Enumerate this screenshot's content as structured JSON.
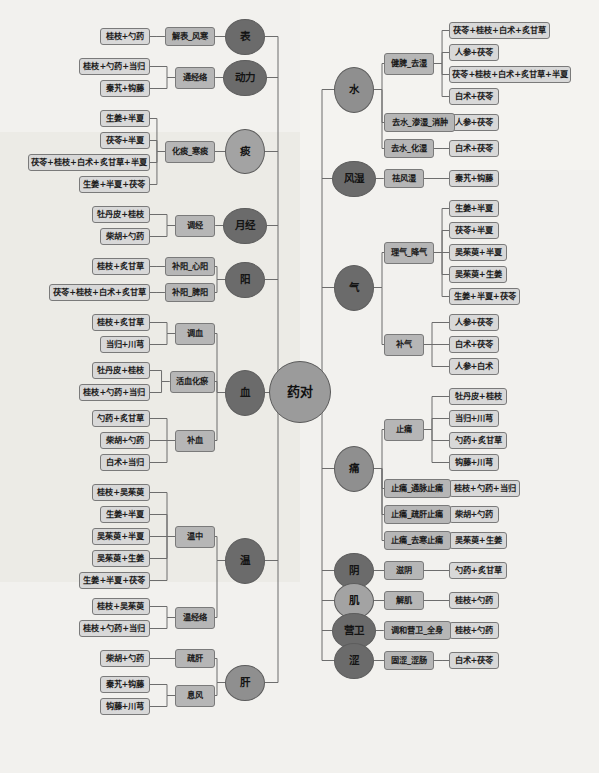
{
  "diagram": {
    "type": "mind-map",
    "root": "药对",
    "title": "药对",
    "colors": {
      "background": "#f2f1ee",
      "root_fill": "#9b9b9b",
      "ellipse_dark": "#6b6b6b",
      "ellipse_mid": "#8f8f8f",
      "ellipse_light": "#a3a3a3",
      "box_mid": "#b6b6b6",
      "box_leaf": "#d8d8d8",
      "link": "#6d6d6d"
    },
    "left_branches": [
      {
        "id": "biao",
        "label": "表",
        "shade": "dark",
        "groups": [
          {
            "label": "解表_风寒",
            "leaves": [
              "桂枝+勺药"
            ]
          }
        ]
      },
      {
        "id": "dongli",
        "label": "动力",
        "shade": "dark",
        "groups": [
          {
            "label": "通经络",
            "leaves": [
              "桂枝+勺药+当归",
              "秦艽+钩藤"
            ]
          }
        ]
      },
      {
        "id": "tan",
        "label": "痰",
        "shade": "light",
        "groups": [
          {
            "label": "化痰_寒痰",
            "leaves": [
              "生姜+半夏",
              "茯苓+半夏",
              "茯苓+桂枝+白术+炙甘草+半夏",
              "生姜+半夏+茯苓"
            ]
          }
        ]
      },
      {
        "id": "yuejing",
        "label": "月经",
        "shade": "dark",
        "groups": [
          {
            "label": "调经",
            "leaves": [
              "牡丹皮+桂枝",
              "柴胡+勺药"
            ]
          }
        ]
      },
      {
        "id": "yang",
        "label": "阳",
        "shade": "dark",
        "groups": [
          {
            "label": "补阳_心阳",
            "leaves": [
              "桂枝+炙甘草"
            ]
          },
          {
            "label": "补阳_脾阳",
            "leaves": [
              "茯苓+桂枝+白术+炙甘草"
            ]
          }
        ]
      },
      {
        "id": "xue",
        "label": "血",
        "shade": "dark",
        "groups": [
          {
            "label": "调血",
            "leaves": [
              "桂枝+炙甘草",
              "当归+川芎"
            ]
          },
          {
            "label": "活血化瘀",
            "leaves": [
              "牡丹皮+桂枝",
              "桂枝+勺药+当归"
            ]
          },
          {
            "label": "补血",
            "leaves": [
              "勺药+炙甘草",
              "柴胡+勺药",
              "白术+当归"
            ]
          }
        ]
      },
      {
        "id": "wen",
        "label": "温",
        "shade": "dark",
        "groups": [
          {
            "label": "温中",
            "leaves": [
              "桂枝+吴茱萸",
              "生姜+半夏",
              "吴茱萸+半夏",
              "吴茱萸+生姜",
              "生姜+半夏+茯苓"
            ]
          },
          {
            "label": "温经络",
            "leaves": [
              "桂枝+吴茱萸",
              "桂枝+勺药+当归"
            ]
          }
        ]
      },
      {
        "id": "gan",
        "label": "肝",
        "shade": "mid",
        "groups": [
          {
            "label": "疏肝",
            "leaves": [
              "柴胡+勺药"
            ]
          },
          {
            "label": "息风",
            "leaves": [
              "秦艽+钩藤",
              "钩藤+川芎"
            ]
          }
        ]
      }
    ],
    "right_branches": [
      {
        "id": "shui",
        "label": "水",
        "shade": "mid",
        "groups": [
          {
            "label": "健脾_去湿",
            "leaves": [
              "茯苓+桂枝+白术+炙甘草",
              "人参+茯苓",
              "茯苓+桂枝+白术+炙甘草+半夏",
              "白术+茯苓"
            ]
          },
          {
            "label": "去水_渗湿_消肿",
            "leaves": [
              "人参+茯苓"
            ]
          },
          {
            "label": "去水_化湿",
            "leaves": [
              "白术+茯苓"
            ]
          }
        ]
      },
      {
        "id": "fengshi",
        "label": "风湿",
        "shade": "dark",
        "groups": [
          {
            "label": "祛风湿",
            "leaves": [
              "秦艽+钩藤"
            ]
          }
        ]
      },
      {
        "id": "qi",
        "label": "气",
        "shade": "dark",
        "groups": [
          {
            "label": "理气_降气",
            "leaves": [
              "生姜+半夏",
              "茯苓+半夏",
              "吴茱萸+半夏",
              "吴茱萸+生姜",
              "生姜+半夏+茯苓"
            ]
          },
          {
            "label": "补气",
            "leaves": [
              "人参+茯苓",
              "白术+茯苓",
              "人参+白术"
            ]
          }
        ]
      },
      {
        "id": "tong",
        "label": "痛",
        "shade": "mid",
        "groups": [
          {
            "label": "止痛",
            "leaves": [
              "牡丹皮+桂枝",
              "当归+川芎",
              "勺药+炙甘草",
              "钩藤+川芎"
            ]
          },
          {
            "label": "止痛_通脉止痛",
            "leaves": [
              "桂枝+勺药+当归"
            ]
          },
          {
            "label": "止痛_疏肝止痛",
            "leaves": [
              "柴胡+勺药"
            ]
          },
          {
            "label": "止痛_去寒止痛",
            "leaves": [
              "吴茱萸+生姜"
            ]
          }
        ]
      },
      {
        "id": "yin",
        "label": "阴",
        "shade": "dark",
        "groups": [
          {
            "label": "滋阴",
            "leaves": [
              "勺药+炙甘草"
            ]
          }
        ]
      },
      {
        "id": "ji",
        "label": "肌",
        "shade": "light",
        "groups": [
          {
            "label": "解肌",
            "leaves": [
              "桂枝+勺药"
            ]
          }
        ]
      },
      {
        "id": "yingwei",
        "label": "营卫",
        "shade": "dark",
        "groups": [
          {
            "label": "调和营卫_全身",
            "leaves": [
              "桂枝+勺药"
            ]
          }
        ]
      },
      {
        "id": "se",
        "label": "涩",
        "shade": "dark",
        "groups": [
          {
            "label": "固涩_涩肠",
            "leaves": [
              "白术+茯苓"
            ]
          }
        ]
      }
    ]
  }
}
